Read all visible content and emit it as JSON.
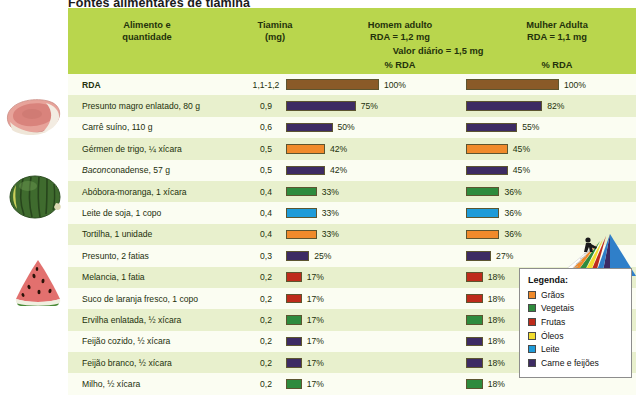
{
  "title": "Fontes alimentares de tiamina",
  "header": {
    "food_col": "Alimento e\nquantidade",
    "food_col_l1": "Alimento e",
    "food_col_l2": "quantidade",
    "thiamine_l1": "Tiamina",
    "thiamine_l2": "(mg)",
    "man_l1": "Homem adulto",
    "man_l2": "RDA = 1,2 mg",
    "woman_l1": "Mulher Adulta",
    "woman_l2": "RDA = 1,1 mg",
    "daily_value": "Valor diário = 1,5 mg",
    "pct_man": "% RDA",
    "pct_woman": "% RDA"
  },
  "legend": {
    "title": "Legenda:",
    "items": [
      {
        "label": "Grãos",
        "color": "#F08A2B"
      },
      {
        "label": "Vegetais",
        "color": "#2E8B3D"
      },
      {
        "label": "Frutas",
        "color": "#BE2B1B"
      },
      {
        "label": "Óleos",
        "color": "#F2DC2E"
      },
      {
        "label": "Leite",
        "color": "#1E9BD9"
      },
      {
        "label": "Carne e feijões",
        "color": "#3D2B63"
      }
    ]
  },
  "chart_data": {
    "type": "bar",
    "title": "Fontes alimentares de tiamina",
    "xlabel": "% RDA",
    "ylabel": "Alimento e quantidade",
    "xlim": [
      0,
      100
    ],
    "grid": false,
    "legend_position": "bottom-right",
    "categories": [
      "RDA",
      "Presunto magro enlatado, 80 g",
      "Carrê suíno, 110 g",
      "Gérmen de trigo, ¼ xícara",
      "Bacon conadense, 57 g",
      "Abóbora-moranga, 1 xícara",
      "Leite de soja, 1 copo",
      "Tortilha, 1 unidade",
      "Presunto, 2 fatias",
      "Melancia, 1 fatia",
      "Suco de laranja fresco, 1 copo",
      "Ervilha enlatada, ½ xícara",
      "Feijão cozido, ½ xícara",
      "Feijão branco, ½ xícara",
      "Milho, ½ xícara"
    ],
    "thiamine_mg": [
      "1,1-1,2",
      "0,9",
      "0,6",
      "0,5",
      "0,5",
      "0,4",
      "0,4",
      "0,4",
      "0,3",
      "0,2",
      "0,2",
      "0,2",
      "0,2",
      "0,2",
      "0,2"
    ],
    "series": [
      {
        "name": "Homem adulto (RDA = 1,2 mg)",
        "values": [
          100,
          75,
          50,
          42,
          42,
          33,
          33,
          33,
          25,
          17,
          17,
          17,
          17,
          17,
          17
        ]
      },
      {
        "name": "Mulher Adulta (RDA = 1,1 mg)",
        "values": [
          100,
          82,
          55,
          45,
          45,
          36,
          36,
          36,
          27,
          18,
          18,
          18,
          18,
          18,
          18
        ]
      }
    ]
  },
  "rows": [
    {
      "food": "RDA",
      "bold": true,
      "italic_lead": "",
      "thiamine": "1,1-1,2",
      "men": 100,
      "men_label": "100%",
      "women": 100,
      "women_label": "100%",
      "color": "#8A5A28"
    },
    {
      "food": "Presunto magro enlatado, 80 g",
      "bold": false,
      "italic_lead": "",
      "thiamine": "0,9",
      "men": 75,
      "men_label": "75%",
      "women": 82,
      "women_label": "82%",
      "color": "#3D2B63"
    },
    {
      "food": "Carrê suíno, 110 g",
      "bold": false,
      "italic_lead": "",
      "thiamine": "0,6",
      "men": 50,
      "men_label": "50%",
      "women": 55,
      "women_label": "55%",
      "color": "#3D2B63"
    },
    {
      "food": "Gérmen de trigo, ¼ xícara",
      "bold": false,
      "italic_lead": "",
      "thiamine": "0,5",
      "men": 42,
      "men_label": "42%",
      "women": 45,
      "women_label": "45%",
      "color": "#F08A2B"
    },
    {
      "food": "Bacon conadense, 57 g",
      "bold": false,
      "italic_lead": "Bacon",
      "thiamine": "0,5",
      "men": 42,
      "men_label": "42%",
      "women": 45,
      "women_label": "45%",
      "color": "#3D2B63"
    },
    {
      "food": "Abóbora-moranga, 1 xícara",
      "bold": false,
      "italic_lead": "",
      "thiamine": "0,4",
      "men": 33,
      "men_label": "33%",
      "women": 36,
      "women_label": "36%",
      "color": "#2E8B3D"
    },
    {
      "food": "Leite de soja, 1 copo",
      "bold": false,
      "italic_lead": "",
      "thiamine": "0,4",
      "men": 33,
      "men_label": "33%",
      "women": 36,
      "women_label": "36%",
      "color": "#1E9BD9"
    },
    {
      "food": "Tortilha, 1 unidade",
      "bold": false,
      "italic_lead": "",
      "thiamine": "0,4",
      "men": 33,
      "men_label": "33%",
      "women": 36,
      "women_label": "36%",
      "color": "#F08A2B"
    },
    {
      "food": "Presunto, 2 fatias",
      "bold": false,
      "italic_lead": "",
      "thiamine": "0,3",
      "men": 25,
      "men_label": "25%",
      "women": 27,
      "women_label": "27%",
      "color": "#3D2B63"
    },
    {
      "food": "Melancia, 1 fatia",
      "bold": false,
      "italic_lead": "",
      "thiamine": "0,2",
      "men": 17,
      "men_label": "17%",
      "women": 18,
      "women_label": "18%",
      "color": "#BE2B1B"
    },
    {
      "food": "Suco de laranja fresco, 1 copo",
      "bold": false,
      "italic_lead": "",
      "thiamine": "0,2",
      "men": 17,
      "men_label": "17%",
      "women": 18,
      "women_label": "18%",
      "color": "#BE2B1B"
    },
    {
      "food": "Ervilha enlatada, ½ xícara",
      "bold": false,
      "italic_lead": "",
      "thiamine": "0,2",
      "men": 17,
      "men_label": "17%",
      "women": 18,
      "women_label": "18%",
      "color": "#2E8B3D"
    },
    {
      "food": "Feijão cozido, ½ xícara",
      "bold": false,
      "italic_lead": "",
      "thiamine": "0,2",
      "men": 17,
      "men_label": "17%",
      "women": 18,
      "women_label": "18%",
      "color": "#3D2B63"
    },
    {
      "food": "Feijão branco, ½ xícara",
      "bold": false,
      "italic_lead": "",
      "thiamine": "0,2",
      "men": 17,
      "men_label": "17%",
      "women": 18,
      "women_label": "18%",
      "color": "#3D2B63"
    },
    {
      "food": "Milho, ½ xícara",
      "bold": false,
      "italic_lead": "",
      "thiamine": "0,2",
      "men": 17,
      "men_label": "17%",
      "women": 18,
      "women_label": "18%",
      "color": "#2E8B3D"
    }
  ],
  "photos": [
    {
      "name": "pork-chop-photo"
    },
    {
      "name": "squash-photo"
    },
    {
      "name": "watermelon-photo"
    }
  ]
}
